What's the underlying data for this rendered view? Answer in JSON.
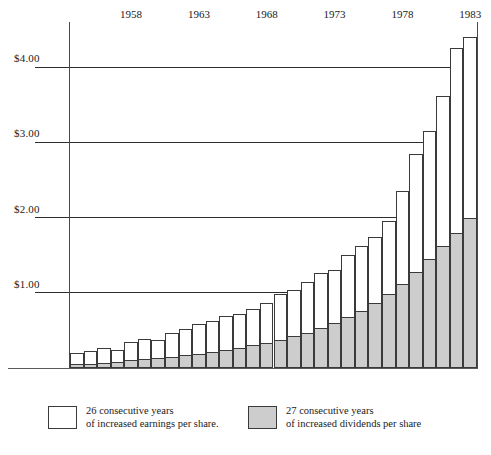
{
  "chart_data": {
    "type": "bar",
    "title": "",
    "subtitle": "",
    "xlabel": "",
    "ylabel": "",
    "stacked": true,
    "grid": true,
    "legend_position": "bottom",
    "ylim": [
      0,
      4.6
    ],
    "ytick_values": [
      1.0,
      2.0,
      3.0,
      4.0
    ],
    "ytick_labels": [
      "$1.00",
      "$2.00",
      "$3.00",
      "$4.00"
    ],
    "xtick_labels": [
      "1958",
      "1963",
      "1968",
      "1973",
      "1978",
      "1983"
    ],
    "xtick_years": [
      1958,
      1963,
      1968,
      1973,
      1978,
      1983
    ],
    "x_start_year": 1954,
    "x_end_year": 1983,
    "categories": [
      "1954",
      "1955",
      "1956",
      "1957",
      "1958",
      "1959",
      "1960",
      "1961",
      "1962",
      "1963",
      "1964",
      "1965",
      "1966",
      "1967",
      "1968",
      "1969",
      "1970",
      "1971",
      "1972",
      "1973",
      "1974",
      "1975",
      "1976",
      "1977",
      "1978",
      "1979",
      "1980",
      "1981",
      "1982",
      "1983"
    ],
    "series": [
      {
        "name": "26 consecutive years of increased earnings per share.",
        "key": "earnings",
        "color": "#ffffff",
        "values": [
          0.2,
          0.23,
          0.26,
          0.24,
          0.34,
          0.38,
          0.37,
          0.46,
          0.52,
          0.58,
          0.63,
          0.69,
          0.72,
          0.79,
          0.86,
          0.98,
          1.04,
          1.15,
          1.26,
          1.3,
          1.5,
          1.62,
          1.74,
          1.95,
          2.35,
          2.85,
          3.15,
          3.62,
          4.25,
          4.4
        ]
      },
      {
        "name": "27 consecutive years of increased dividends per share",
        "key": "dividends",
        "color": "#cdcdcd",
        "values": [
          0.05,
          0.06,
          0.07,
          0.08,
          0.1,
          0.12,
          0.13,
          0.15,
          0.17,
          0.19,
          0.21,
          0.24,
          0.27,
          0.3,
          0.33,
          0.37,
          0.42,
          0.47,
          0.53,
          0.6,
          0.68,
          0.76,
          0.86,
          0.98,
          1.12,
          1.28,
          1.45,
          1.62,
          1.8,
          2.0
        ]
      }
    ]
  },
  "legend": {
    "items": [
      {
        "swatch": "white",
        "line1": "26 consecutive years",
        "line2": "of increased earnings per share."
      },
      {
        "swatch": "gray",
        "line1": "27 consecutive years",
        "line2": "of increased dividends per share"
      }
    ]
  },
  "colors": {
    "earnings_fill": "#ffffff",
    "dividends_fill": "#cdcdcd",
    "bar_stroke": "#3a3a3a",
    "gridline": "#2e2e2e",
    "axis": "#4a4a4a",
    "text": "#1a1a1a",
    "background": "#ffffff"
  }
}
